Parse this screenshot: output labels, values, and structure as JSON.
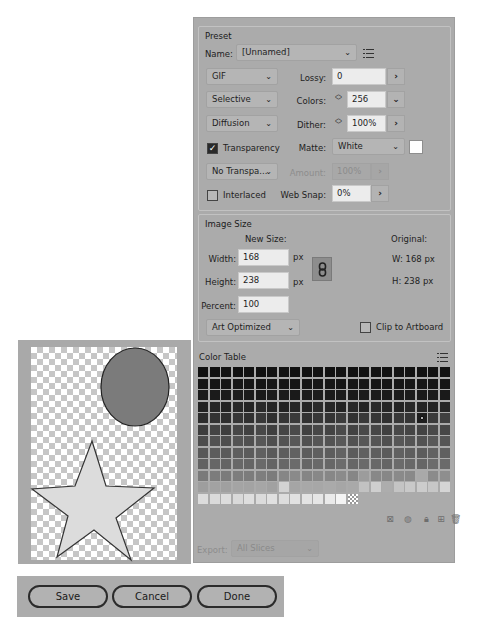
{
  "preset": {
    "title": "Preset",
    "name_label": "Name:",
    "name_value": "[Unnamed]",
    "format": "GIF",
    "reduction": "Selective",
    "dither_algorithm": "Diffusion",
    "transparency_label": "Transparency",
    "transparency_checked": true,
    "transparency_dither": "No Transpa...",
    "interlaced_label": "Interlaced",
    "interlaced_checked": false,
    "lossy_label": "Lossy:",
    "lossy_value": "0",
    "colors_label": "Colors:",
    "colors_value": "256",
    "dither_label": "Dither:",
    "dither_value": "100%",
    "matte_label": "Matte:",
    "matte_value": "White",
    "matte_color": "#ffffff",
    "amount_label": "Amount:",
    "amount_value": "100%",
    "websnap_label": "Web Snap:",
    "websnap_value": "0%"
  },
  "image_size": {
    "title": "Image Size",
    "new_size_label": "New Size:",
    "width_label": "Width:",
    "width_value": "168",
    "height_label": "Height:",
    "height_value": "238",
    "percent_label": "Percent:",
    "percent_value": "100",
    "unit": "px",
    "original_label": "Original:",
    "original_w": "W:  168 px",
    "original_h": "H:  238 px",
    "resample": "Art Optimized",
    "clip_label": "Clip to Artboard",
    "clip_checked": false
  },
  "color_table": {
    "title": "Color Table",
    "columns": 22,
    "rows": [
      [
        "#111111",
        "#111111",
        "#121212",
        "#111111",
        "#121212",
        "#111111",
        "#131313",
        "#121212",
        "#111111",
        "#121212",
        "#131313",
        "#111111",
        "#121212",
        "#111111",
        "#121212",
        "#131313",
        "#111111",
        "#121212",
        "#111111",
        "#121212",
        "#131313",
        "#121212"
      ],
      [
        "#161616",
        "#151515",
        "#161616",
        "#171717",
        "#161616",
        "#151515",
        "#171717",
        "#161616",
        "#151515",
        "#161616",
        "#171717",
        "#161616",
        "#151515",
        "#161616",
        "#171717",
        "#161616",
        "#151515",
        "#161616",
        "#171717",
        "#161616",
        "#151515",
        "#161616"
      ],
      [
        "#1a1a1a",
        "#1b1b1b",
        "#1a1a1a",
        "#1c1c1c",
        "#1b1b1b",
        "#1a1a1a",
        "#1c1c1c",
        "#1b1b1b",
        "#1a1a1a",
        "#1b1b1b",
        "#1c1c1c",
        "#1a1a1a",
        "#1b1b1b",
        "#1a1a1a",
        "#1c1c1c",
        "#1b1b1b",
        "#1a1a1a",
        "#1b1b1b",
        "#1c1c1c",
        "#1a1a1a",
        "#1b1b1b",
        "#1a1a1a"
      ],
      [
        "#222222",
        "#262626",
        "#232323",
        "#282828",
        "#242424",
        "#2a2a2a",
        "#252525",
        "#232323",
        "#272727",
        "#242424",
        "#2b2b2b",
        "#262626",
        "#232323",
        "#292929",
        "#242424",
        "#2a2a2a",
        "#262626",
        "#232323",
        "#282828",
        "#242424",
        "#232323",
        "#262626"
      ],
      [
        "#2c2c2c",
        "#333333",
        "#2e2e2e",
        "#363636",
        "#303030",
        "#383838",
        "#2f2f2f",
        "#353535",
        "#3a3a3a",
        "#313131",
        "#373737",
        "#343434",
        "#3b3b3b",
        "#323232",
        "#393939",
        "#363636",
        "#303030",
        "#383838",
        "#353535",
        "#1e1e1e",
        "#3a3a3a",
        "#404040"
      ],
      [
        "#3c3c3c",
        "#444444",
        "#3e3e3e",
        "#464646",
        "#404040",
        "#484848",
        "#3f3f3f",
        "#454545",
        "#4a4a4a",
        "#414141",
        "#474747",
        "#444444",
        "#4b4b4b",
        "#424242",
        "#494949",
        "#464646",
        "#404040",
        "#484848",
        "#454545",
        "#434343",
        "#4a4a4a",
        "#474747"
      ],
      [
        "#4c4c4c",
        "#525252",
        "#4e4e4e",
        "#545454",
        "#505050",
        "#575757",
        "#4f4f4f",
        "#535353",
        "#585858",
        "#515151",
        "#565656",
        "#535353",
        "#595959",
        "#525252",
        "#575757",
        "#555555",
        "#505050",
        "#575757",
        "#545454",
        "#525252",
        "#595959",
        "#565656"
      ],
      [
        "#585858",
        "#5c5c5c",
        "#5a5a5a",
        "#5e5e5e",
        "#5b5b5b",
        "#606060",
        "#5a5a5a",
        "#5d5d5d",
        "#616161",
        "#5c5c5c",
        "#5f5f5f",
        "#5d5d5d",
        "#626262",
        "#5c5c5c",
        "#606060",
        "#5e5e5e",
        "#5b5b5b",
        "#616161",
        "#5e5e5e",
        "#5c5c5c",
        "#626262",
        "#606060"
      ],
      [
        "#626262",
        "#666666",
        "#646464",
        "#686868",
        "#656565",
        "#6a6a6a",
        "#646464",
        "#676767",
        "#6b6b6b",
        "#666666",
        "#696969",
        "#676767",
        "#6c6c6c",
        "#666666",
        "#6a6a6a",
        "#686868",
        "#656565",
        "#6b6b6b",
        "#686868",
        "#666666",
        "#6c6c6c",
        "#6a6a6a"
      ],
      [
        "#7a7a7a",
        "#7c7c7c",
        "#7b7b7b",
        "#7d7d7d",
        "#7c7c7c",
        "#7e7e7e",
        "#7b7b7b",
        "#868686",
        "#8a8a8a",
        "#858585",
        "#888888",
        "#878787",
        "#8b8b8b",
        "#868686",
        "#9c9c9c",
        "#888888",
        "#878787",
        "#8a8a8a",
        "#898989",
        "#a9a9a9",
        "#8b8b8b",
        "#8e8e8e"
      ],
      [
        "#9e9e9e",
        "#a2a2a2",
        "#a0a0a0",
        "#a4a4a4",
        "#a3a3a3",
        "#a6a6a6",
        "#a1a1a1",
        "#d2d2d2",
        "#a5a5a5",
        "#a8a8a8",
        "#a7a7a7",
        "#aaaaaa",
        "#a6a6a6",
        "#a9a9a9",
        "#c2c2c2",
        "#cfcfcf",
        "#adadad",
        "#c4c4c4",
        "#c9c9c9",
        "#cccccc",
        "#c7c7c7",
        "#d5d5d5"
      ],
      [
        "#dcdcdc",
        "#dadada",
        "#dddddd",
        "#d9d9d9",
        "#dedede",
        "#dbdbdb",
        "#e0e0e0",
        "#dddddd",
        "#e1e1e1",
        "#e3e3e3",
        "#e6e6e6",
        "#eaeaea",
        "#f4f4f4",
        "transparent"
      ]
    ],
    "selected_cell": [
      4,
      19
    ]
  },
  "color_table_tools": [
    "map-to-transparent-icon",
    "web-shift-icon",
    "lock-icon",
    "new-color-icon",
    "delete-icon"
  ],
  "export": {
    "label": "Export:",
    "value": "All Slices"
  },
  "preview": {
    "ellipse_fill": "#7b7b7b",
    "star_fill": "#dcdcdc"
  },
  "buttons": {
    "save": "Save",
    "cancel": "Cancel",
    "done": "Done"
  },
  "glyphs": {
    "chevron": "⌄",
    "arrow": "›",
    "spin_up": "︿",
    "spin_down": "﹀",
    "check": "✓"
  }
}
